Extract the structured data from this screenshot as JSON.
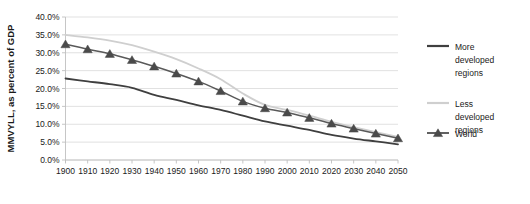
{
  "chart_data": {
    "type": "line",
    "title": "",
    "xlabel": "",
    "ylabel": "MMVYLL, as percent of GDP",
    "xlim": [
      1900,
      2050
    ],
    "ylim": [
      0,
      0.4
    ],
    "grid": true,
    "legend_position": "right",
    "x": [
      1900,
      1910,
      1920,
      1930,
      1940,
      1950,
      1960,
      1970,
      1980,
      1990,
      2000,
      2010,
      2020,
      2030,
      2040,
      2050
    ],
    "ytick_labels": [
      "0.0%",
      "5.0%",
      "10.0%",
      "15.0%",
      "20.0%",
      "25.0%",
      "30.0%",
      "35.0%",
      "40.0%"
    ],
    "ytick_values": [
      0,
      5,
      10,
      15,
      20,
      25,
      30,
      35,
      40
    ],
    "xtick_labels": [
      "1900",
      "1910",
      "1920",
      "1930",
      "1940",
      "1950",
      "1960",
      "1970",
      "1980",
      "1990",
      "2000",
      "2010",
      "2020",
      "2030",
      "2040",
      "2050"
    ],
    "series": [
      {
        "name": "More developed regions",
        "legend_label_lines": [
          "More",
          "developed",
          "regions"
        ],
        "color": "#3f3f3f",
        "marker": "none",
        "width": 1.8,
        "values": [
          22.8,
          22.0,
          21.2,
          20.2,
          18.2,
          16.8,
          15.3,
          14.0,
          12.4,
          10.8,
          9.6,
          8.4,
          7.0,
          6.0,
          5.2,
          4.4
        ]
      },
      {
        "name": "Less developed regions",
        "legend_label_lines": [
          "Less",
          "developed",
          "regions"
        ],
        "color": "#cfcfcf",
        "marker": "none",
        "width": 1.8,
        "values": [
          35.0,
          34.3,
          33.4,
          32.1,
          30.3,
          28.2,
          25.6,
          22.6,
          18.6,
          15.4,
          14.0,
          12.4,
          10.7,
          9.2,
          7.8,
          6.5
        ]
      },
      {
        "name": "World",
        "legend_label_lines": [
          "World"
        ],
        "color": "#595959",
        "marker": "triangle",
        "width": 1.5,
        "values": [
          32.4,
          31.0,
          29.7,
          28.0,
          26.2,
          24.2,
          22.0,
          19.3,
          16.4,
          14.5,
          13.3,
          11.8,
          10.2,
          8.8,
          7.4,
          6.1
        ]
      }
    ]
  },
  "icons": {
    "legend_marker": "triangle-marker-icon"
  }
}
